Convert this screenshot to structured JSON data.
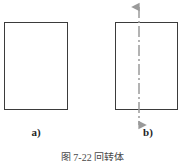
{
  "figure": {
    "caption": "图 7-22  回转体",
    "stroke_color": "#3b3b3b",
    "axis_color": "#9a9a9a",
    "background_color": "#ffffff",
    "panels": [
      {
        "id": "a",
        "label": "a)",
        "shape": "rectangle",
        "has_axis": false
      },
      {
        "id": "b",
        "label": "b)",
        "shape": "rectangle",
        "has_axis": true,
        "axis_style": "dash-dot centerline with arrowheads at both ends",
        "axis_orientation": "vertical"
      }
    ]
  }
}
